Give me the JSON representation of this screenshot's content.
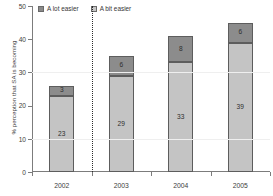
{
  "chart_data": {
    "type": "bar",
    "subtype": "stacked-bar",
    "title": "",
    "xlabel": "",
    "ylabel": "% perception that SA is becoming",
    "categories": [
      "2002",
      "2003",
      "2004",
      "2005"
    ],
    "series": [
      {
        "name": "A bit easier",
        "values": [
          23,
          29,
          33,
          39
        ],
        "color": "#c4c4c4"
      },
      {
        "name": "A lot easier",
        "values": [
          3,
          6,
          8,
          6
        ],
        "color": "#8c8c8c"
      }
    ],
    "stack_order": [
      "A bit easier",
      "A lot easier"
    ],
    "totals": [
      26,
      35,
      41,
      45
    ],
    "ylim": [
      0,
      50
    ],
    "yticks": [
      0,
      10,
      20,
      30,
      40,
      50
    ],
    "ytick_labels": [
      "0",
      "10",
      "20",
      "30",
      "40",
      "50"
    ],
    "grid": false,
    "legend_position": "top-left",
    "annotations": [
      {
        "type": "vertical-dotted-line",
        "between": [
          "2002",
          "2003"
        ]
      }
    ]
  },
  "legend": {
    "items": [
      {
        "label": "A lot easier",
        "swatch": "dark-gray-swatch"
      },
      {
        "label": "A bit easier",
        "swatch": "light-gray-swatch"
      }
    ]
  },
  "axes": {
    "y_title": "% perception that SA is becoming"
  }
}
